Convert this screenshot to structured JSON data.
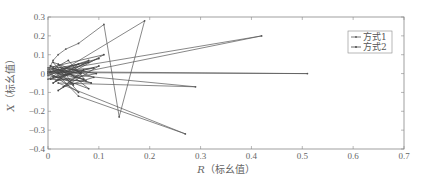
{
  "chart_data": {
    "type": "line",
    "title": "",
    "xlabel": "R（标幺值）",
    "ylabel": "X（标幺值）",
    "xlabel_italic_part": "R",
    "xlabel_rest": "（标幺值）",
    "ylabel_italic_part": "X",
    "ylabel_rest": "（标幺值）",
    "xlim": [
      0,
      0.7
    ],
    "ylim": [
      -0.4,
      0.3
    ],
    "xticks": [
      "0",
      "0.1",
      "0.2",
      "0.3",
      "0.4",
      "0.5",
      "0.6",
      "0.7"
    ],
    "yticks": [
      "0.3",
      "0.2",
      "0.1",
      "0",
      "-0.1",
      "-0.2",
      "-0.3",
      "-0.4"
    ],
    "grid": false,
    "legend_position": "upper right",
    "series": [
      {
        "name": "方式1",
        "color": "#555555",
        "marker": "dot",
        "points": [
          [
            0.0,
            0.0
          ],
          [
            0.005,
            0.04
          ],
          [
            0.01,
            0.07
          ],
          [
            0.02,
            0.1
          ],
          [
            0.035,
            0.13
          ],
          [
            0.06,
            0.16
          ],
          [
            0.11,
            0.26
          ],
          [
            0.14,
            -0.23
          ],
          [
            0.19,
            0.28
          ],
          [
            0.0,
            -0.03
          ],
          [
            0.42,
            0.2
          ],
          [
            0.0,
            0.01
          ],
          [
            0.51,
            0.0
          ],
          [
            0.0,
            0.005
          ],
          [
            0.29,
            -0.07
          ],
          [
            0.02,
            -0.05
          ],
          [
            0.27,
            -0.32
          ],
          [
            0.06,
            -0.12
          ],
          [
            0.01,
            0.02
          ]
        ]
      },
      {
        "name": "方式2",
        "color": "#444444",
        "marker": "dot",
        "points": [
          [
            0.0,
            0.02
          ],
          [
            0.08,
            0.06
          ],
          [
            0.01,
            -0.02
          ],
          [
            0.09,
            0.03
          ],
          [
            0.005,
            0.01
          ],
          [
            0.1,
            0.08
          ],
          [
            0.02,
            0.0
          ],
          [
            0.07,
            -0.03
          ],
          [
            0.01,
            0.03
          ],
          [
            0.085,
            -0.05
          ],
          [
            0.0,
            -0.01
          ],
          [
            0.06,
            0.05
          ],
          [
            0.015,
            -0.04
          ],
          [
            0.095,
            0.0
          ],
          [
            0.005,
            0.04
          ],
          [
            0.05,
            -0.06
          ],
          [
            0.02,
            0.05
          ],
          [
            0.08,
            -0.08
          ],
          [
            0.0,
            0.0
          ],
          [
            0.07,
            0.02
          ],
          [
            0.03,
            -0.07
          ],
          [
            0.09,
            -0.02
          ],
          [
            0.01,
            0.06
          ],
          [
            0.06,
            -0.1
          ],
          [
            0.0,
            0.01
          ],
          [
            0.04,
            0.07
          ],
          [
            0.075,
            -0.04
          ],
          [
            0.005,
            -0.03
          ],
          [
            0.1,
            0.04
          ],
          [
            0.02,
            -0.09
          ],
          [
            0.065,
            0.0
          ],
          [
            0.0,
            0.03
          ],
          [
            0.11,
            0.1
          ],
          [
            0.01,
            -0.05
          ],
          [
            0.08,
            0.07
          ],
          [
            0.0,
            0.0
          ]
        ]
      }
    ]
  }
}
